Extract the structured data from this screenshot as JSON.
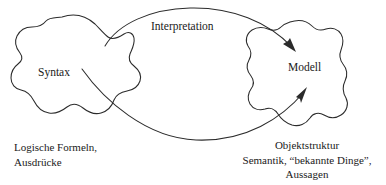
{
  "diagram": {
    "background_color": "#ffffff",
    "stroke_color": "#2b2b2b",
    "nodes": [
      {
        "id": "syntax",
        "label": "Syntax",
        "shape": "hand-drawn-blob",
        "position": "left"
      },
      {
        "id": "modell",
        "label": "Modell",
        "shape": "hand-drawn-blob",
        "position": "right"
      }
    ],
    "edges": [
      {
        "id": "interpretation-upper",
        "label": "Interpretation",
        "from": "syntax",
        "to": "modell",
        "direction": "left-to-right",
        "curve": "arc-over",
        "arrowhead": "filled-triangle"
      },
      {
        "id": "interpretation-lower",
        "label": "",
        "from": "syntax",
        "to": "modell",
        "direction": "left-to-right",
        "curve": "arc-under",
        "arrowhead": "filled-triangle"
      }
    ],
    "captions": {
      "left": {
        "lines": [
          "Logische Formeln,",
          "Ausdrücke"
        ]
      },
      "right": {
        "lines": [
          "Objektstruktur",
          "Semantik, “bekannte Dinge”,",
          "Aussagen"
        ]
      }
    }
  }
}
